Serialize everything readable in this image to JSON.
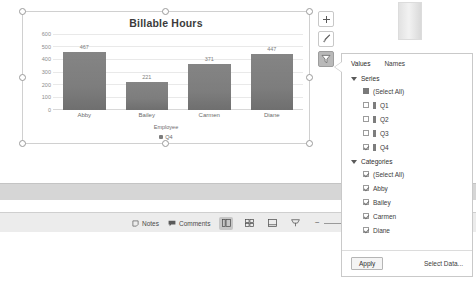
{
  "chart_data": {
    "type": "bar",
    "title": "Billable Hours",
    "categories": [
      "Abby",
      "Bailey",
      "Carmen",
      "Diane"
    ],
    "values": [
      467,
      221,
      371,
      447
    ],
    "series": [
      {
        "name": "Q4",
        "values": [
          467,
          221,
          371,
          447
        ]
      }
    ],
    "xlabel": "Employee",
    "ylabel": "",
    "ylim": [
      0,
      600
    ],
    "yticks": [
      600,
      500,
      400,
      300,
      200,
      100,
      0
    ],
    "grid": true,
    "legend": {
      "position": "bottom",
      "entries": [
        "Q4"
      ]
    },
    "bar_color": "#7d7d7d"
  },
  "chart_buttons": [
    {
      "name": "chart-elements",
      "glyph": "+",
      "active": false
    },
    {
      "name": "chart-styles",
      "glyph": "brush",
      "active": false
    },
    {
      "name": "chart-filters",
      "glyph": "funnel",
      "active": true
    }
  ],
  "filter_panel": {
    "tabs": [
      {
        "label": "Values",
        "selected": true
      },
      {
        "label": "Names",
        "selected": false
      }
    ],
    "groups": [
      {
        "title": "Series",
        "rows": [
          {
            "label": "(Select All)",
            "state": "indeterminate",
            "swatch": false
          },
          {
            "label": "Q1",
            "state": "unchecked",
            "swatch": true
          },
          {
            "label": "Q2",
            "state": "unchecked",
            "swatch": true
          },
          {
            "label": "Q3",
            "state": "unchecked",
            "swatch": true
          },
          {
            "label": "Q4",
            "state": "checked",
            "swatch": true
          }
        ]
      },
      {
        "title": "Categories",
        "rows": [
          {
            "label": "(Select All)",
            "state": "checked",
            "swatch": false
          },
          {
            "label": "Abby",
            "state": "checked",
            "swatch": false
          },
          {
            "label": "Bailey",
            "state": "checked",
            "swatch": false
          },
          {
            "label": "Carmen",
            "state": "checked",
            "swatch": false
          },
          {
            "label": "Diane",
            "state": "checked",
            "swatch": false
          }
        ]
      }
    ],
    "apply_label": "Apply",
    "select_data_label": "Select Data..."
  },
  "status_bar": {
    "notes_label": "Notes",
    "comments_label": "Comments",
    "zoom_minus": "−",
    "zoom_plus": "+"
  }
}
